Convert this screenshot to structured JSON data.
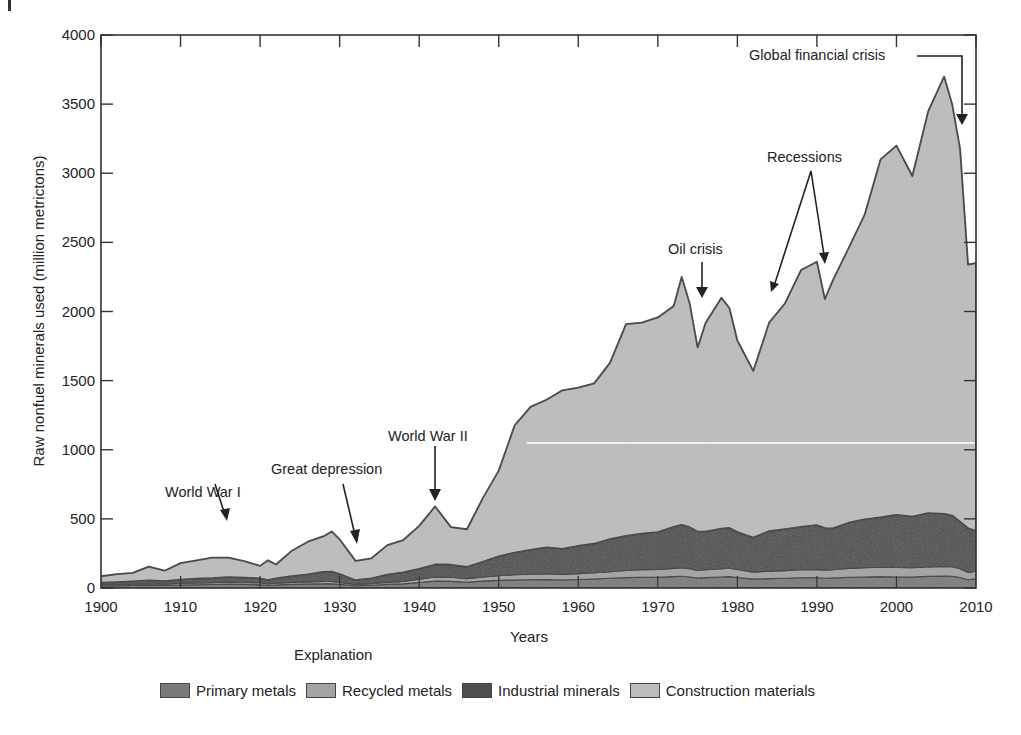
{
  "chart_data": {
    "type": "area",
    "stacked": true,
    "title": "",
    "xlabel": "Years",
    "ylabel": "Raw nonfuel minerals used (million metrictons)",
    "xlim": [
      1900,
      2010
    ],
    "ylim": [
      0,
      4000
    ],
    "x_ticks": [
      1900,
      1910,
      1920,
      1930,
      1940,
      1950,
      1960,
      1970,
      1980,
      1990,
      2000,
      2010
    ],
    "y_ticks": [
      0,
      500,
      1000,
      1500,
      2000,
      2500,
      3000,
      3500,
      4000
    ],
    "grid": false,
    "legend_title": "Explanation",
    "legend_position": "bottom",
    "x": [
      1900,
      1902,
      1904,
      1906,
      1908,
      1910,
      1912,
      1914,
      1916,
      1918,
      1920,
      1921,
      1922,
      1924,
      1926,
      1928,
      1929,
      1930,
      1932,
      1934,
      1936,
      1938,
      1940,
      1942,
      1944,
      1946,
      1948,
      1950,
      1952,
      1954,
      1956,
      1958,
      1960,
      1962,
      1964,
      1966,
      1968,
      1970,
      1972,
      1973,
      1974,
      1975,
      1976,
      1978,
      1979,
      1980,
      1982,
      1984,
      1986,
      1988,
      1990,
      1991,
      1992,
      1994,
      1996,
      1998,
      2000,
      2002,
      2004,
      2006,
      2007,
      2008,
      2009,
      2010
    ],
    "series": [
      {
        "name": "Primary metals",
        "color": "#7a7a7a",
        "values": [
          15,
          16,
          18,
          20,
          18,
          22,
          24,
          25,
          28,
          26,
          24,
          18,
          22,
          26,
          28,
          30,
          30,
          26,
          16,
          20,
          26,
          30,
          40,
          50,
          48,
          42,
          50,
          55,
          58,
          60,
          62,
          58,
          62,
          65,
          70,
          75,
          78,
          78,
          82,
          85,
          80,
          72,
          75,
          80,
          82,
          76,
          64,
          68,
          70,
          74,
          74,
          70,
          72,
          78,
          80,
          82,
          80,
          80,
          84,
          86,
          84,
          76,
          60,
          66
        ]
      },
      {
        "name": "Recycled metals",
        "color": "#a3a3a3",
        "values": [
          8,
          9,
          10,
          11,
          10,
          12,
          13,
          14,
          16,
          15,
          14,
          11,
          13,
          15,
          16,
          17,
          17,
          15,
          10,
          12,
          15,
          18,
          24,
          30,
          30,
          26,
          30,
          34,
          38,
          40,
          42,
          40,
          42,
          45,
          48,
          52,
          55,
          56,
          60,
          62,
          60,
          55,
          57,
          60,
          62,
          58,
          50,
          54,
          56,
          58,
          60,
          58,
          60,
          64,
          66,
          68,
          68,
          66,
          68,
          70,
          70,
          64,
          52,
          56
        ]
      },
      {
        "name": "Industrial minerals",
        "color": "#4e4e4e",
        "values": [
          15,
          17,
          20,
          24,
          22,
          26,
          30,
          32,
          35,
          33,
          32,
          28,
          35,
          45,
          55,
          70,
          72,
          60,
          30,
          38,
          55,
          65,
          75,
          90,
          90,
          85,
          110,
          140,
          160,
          175,
          190,
          185,
          200,
          210,
          235,
          250,
          260,
          270,
          300,
          310,
          300,
          280,
          275,
          290,
          290,
          270,
          250,
          290,
          300,
          310,
          320,
          305,
          300,
          330,
          350,
          360,
          380,
          370,
          390,
          380,
          370,
          340,
          320,
          290
        ]
      },
      {
        "name": "Construction materials",
        "color": "#bdbdbd",
        "values": [
          47,
          58,
          62,
          100,
          75,
          120,
          133,
          149,
          141,
          121,
          90,
          143,
          100,
          184,
          236,
          258,
          290,
          251,
          140,
          145,
          214,
          234,
          310,
          420,
          272,
          272,
          460,
          620,
          920,
          1035,
          1068,
          1147,
          1146,
          1160,
          1277,
          1531,
          1527,
          1553,
          1598,
          1793,
          1620,
          1333,
          1510,
          1670,
          1591,
          1386,
          1206,
          1508,
          1634,
          1858,
          1906,
          1657,
          1793,
          1988,
          2204,
          2590,
          2672,
          2464,
          2908,
          3164,
          2976,
          2696,
          1908,
          1938
        ]
      }
    ],
    "totals_approx": [
      85,
      100,
      110,
      155,
      125,
      180,
      200,
      220,
      220,
      195,
      160,
      200,
      170,
      270,
      335,
      375,
      409,
      352,
      196,
      215,
      310,
      347,
      449,
      590,
      440,
      425,
      650,
      849,
      1176,
      1310,
      1362,
      1430,
      1450,
      1480,
      1630,
      1908,
      1920,
      1957,
      2040,
      2250,
      2060,
      1740,
      1917,
      2100,
      2025,
      1790,
      1570,
      1920,
      2060,
      2300,
      2360,
      2090,
      2225,
      2460,
      2700,
      3100,
      3200,
      2980,
      3450,
      3700,
      3500,
      3176,
      2340,
      2350
    ],
    "annotations": [
      {
        "text": "World War I",
        "x": 1916,
        "arrow_to_y": 215
      },
      {
        "text": "Great depression",
        "x": 1932,
        "arrow_to_y": 300
      },
      {
        "text": "World War II",
        "x": 1942,
        "arrow_to_y": 590
      },
      {
        "text": "Oil crisis",
        "x": 1975,
        "arrow_to_y": 2090
      },
      {
        "text": "Recessions",
        "x": [
          1984,
          1991
        ],
        "arrow_to_y": [
          2150,
          2300
        ]
      },
      {
        "text": "Global financial crisis",
        "x": 2008,
        "arrow_to_y": 3350
      }
    ]
  },
  "labels": {
    "xlabel": "Years",
    "ylabel": "Raw nonfuel minerals used (million metrictons)",
    "explanation": "Explanation",
    "annotations": {
      "ww1": "World War I",
      "depression": "Great depression",
      "ww2": "World War II",
      "oil": "Oil crisis",
      "recessions": "Recessions",
      "gfc": "Global financial crisis"
    }
  },
  "legend": [
    {
      "label": "Primary metals",
      "color": "#7a7a7a"
    },
    {
      "label": "Recycled metals",
      "color": "#a3a3a3"
    },
    {
      "label": "Industrial minerals",
      "color": "#4e4e4e"
    },
    {
      "label": "Construction materials",
      "color": "#bdbdbd"
    }
  ]
}
